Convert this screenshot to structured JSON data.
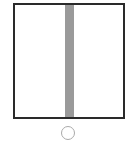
{
  "diagram": {
    "frame": {
      "shape": "square-outline",
      "border_color": "#2a2a2a",
      "fill": "#ffffff"
    },
    "bar": {
      "shape": "vertical-bar",
      "orientation": "vertical",
      "color": "#9a9a9a",
      "position": "center"
    },
    "indicator": {
      "shape": "circle-outline",
      "color": "#aaaaaa",
      "filled": false
    }
  }
}
